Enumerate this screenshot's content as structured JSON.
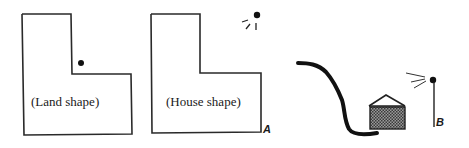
{
  "diagram": {
    "panels": [
      {
        "id": "land",
        "label": "(Land shape)"
      },
      {
        "id": "house",
        "label": "(House shape)",
        "corner_label": "A"
      },
      {
        "id": "section",
        "pole_label": "B"
      }
    ],
    "colors": {
      "line": "#2a2a2a",
      "fill_hatch": "#6a6a6a",
      "background": "#ffffff"
    }
  }
}
